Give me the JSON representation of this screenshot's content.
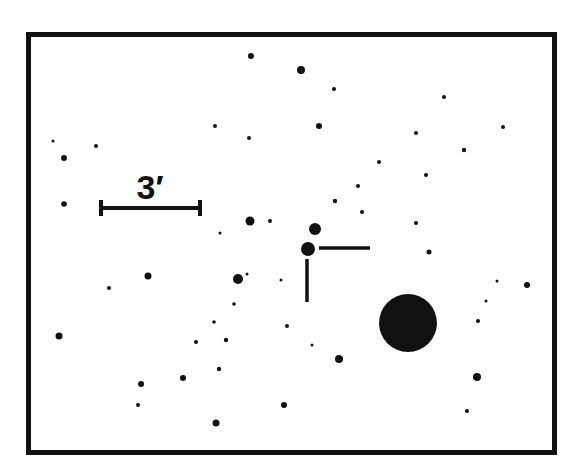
{
  "chart": {
    "ink_color": "#111111",
    "background_color": "#ffffff",
    "frame": {
      "x": 26,
      "y": 32,
      "width": 531,
      "height": 423,
      "stroke_width": 5
    },
    "scale_bar": {
      "label": "3′",
      "x1": 100,
      "x2": 201,
      "y": 208,
      "cap_half_height": 8,
      "label_x": 150,
      "label_y": 199
    },
    "target_marker": {
      "horizontal": {
        "x1": 319,
        "y1": 248,
        "x2": 370,
        "y2": 248
      },
      "vertical": {
        "x1": 307,
        "y1": 259,
        "x2": 307,
        "y2": 302
      }
    },
    "stars": [
      {
        "x": 251,
        "y": 56,
        "r": 3
      },
      {
        "x": 301,
        "y": 70,
        "r": 4
      },
      {
        "x": 334,
        "y": 89,
        "r": 2
      },
      {
        "x": 444,
        "y": 97,
        "r": 2
      },
      {
        "x": 215,
        "y": 126,
        "r": 2
      },
      {
        "x": 319,
        "y": 126,
        "r": 3
      },
      {
        "x": 416,
        "y": 133,
        "r": 2
      },
      {
        "x": 503,
        "y": 127,
        "r": 2
      },
      {
        "x": 249,
        "y": 138,
        "r": 2
      },
      {
        "x": 53,
        "y": 141,
        "r": 1.5
      },
      {
        "x": 96,
        "y": 146,
        "r": 2
      },
      {
        "x": 464,
        "y": 150,
        "r": 2.2
      },
      {
        "x": 64,
        "y": 158,
        "r": 3
      },
      {
        "x": 379,
        "y": 162,
        "r": 2
      },
      {
        "x": 426,
        "y": 175,
        "r": 2
      },
      {
        "x": 358,
        "y": 186,
        "r": 2
      },
      {
        "x": 335,
        "y": 201,
        "r": 2.2
      },
      {
        "x": 64,
        "y": 204,
        "r": 2.8
      },
      {
        "x": 362,
        "y": 212,
        "r": 2
      },
      {
        "x": 250,
        "y": 221,
        "r": 4.5
      },
      {
        "x": 270,
        "y": 221,
        "r": 2
      },
      {
        "x": 416,
        "y": 223,
        "r": 2
      },
      {
        "x": 315,
        "y": 229,
        "r": 6
      },
      {
        "x": 220,
        "y": 233,
        "r": 1.5
      },
      {
        "x": 308,
        "y": 249,
        "r": 7
      },
      {
        "x": 429,
        "y": 252,
        "r": 2.5
      },
      {
        "x": 247,
        "y": 274,
        "r": 1.5
      },
      {
        "x": 148,
        "y": 276,
        "r": 3.5
      },
      {
        "x": 238,
        "y": 279,
        "r": 5
      },
      {
        "x": 281,
        "y": 280,
        "r": 1.5
      },
      {
        "x": 497,
        "y": 281,
        "r": 1.5
      },
      {
        "x": 527,
        "y": 285,
        "r": 3
      },
      {
        "x": 109,
        "y": 288,
        "r": 2
      },
      {
        "x": 486,
        "y": 301,
        "r": 1.5
      },
      {
        "x": 234,
        "y": 304,
        "r": 1.8
      },
      {
        "x": 478,
        "y": 321,
        "r": 2
      },
      {
        "x": 214,
        "y": 322,
        "r": 1.8
      },
      {
        "x": 408,
        "y": 323,
        "r": 29
      },
      {
        "x": 287,
        "y": 326,
        "r": 2
      },
      {
        "x": 59,
        "y": 336,
        "r": 3.5
      },
      {
        "x": 226,
        "y": 340,
        "r": 2.2
      },
      {
        "x": 196,
        "y": 342,
        "r": 2
      },
      {
        "x": 312,
        "y": 345,
        "r": 1.5
      },
      {
        "x": 339,
        "y": 359,
        "r": 4
      },
      {
        "x": 219,
        "y": 369,
        "r": 2.2
      },
      {
        "x": 477,
        "y": 377,
        "r": 4
      },
      {
        "x": 183,
        "y": 378,
        "r": 3
      },
      {
        "x": 141,
        "y": 384,
        "r": 3
      },
      {
        "x": 138,
        "y": 405,
        "r": 2
      },
      {
        "x": 284,
        "y": 405,
        "r": 3
      },
      {
        "x": 467,
        "y": 411,
        "r": 2
      },
      {
        "x": 216,
        "y": 423,
        "r": 3.5
      }
    ]
  }
}
